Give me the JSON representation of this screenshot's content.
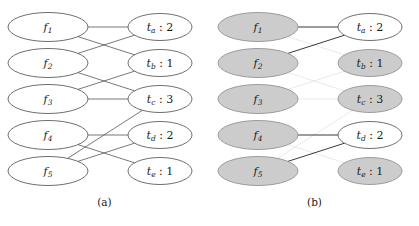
{
  "figure": {
    "panels": [
      {
        "id": "a",
        "caption": "(a)",
        "left_nodes": [
          {
            "id": "f1",
            "base": "f",
            "sub": "1",
            "shaded": false
          },
          {
            "id": "f2",
            "base": "f",
            "sub": "2",
            "shaded": false
          },
          {
            "id": "f3",
            "base": "f",
            "sub": "3",
            "shaded": false
          },
          {
            "id": "f4",
            "base": "f",
            "sub": "4",
            "shaded": false
          },
          {
            "id": "f5",
            "base": "f",
            "sub": "5",
            "shaded": false
          }
        ],
        "right_nodes": [
          {
            "id": "ta",
            "base": "t",
            "sub": "a",
            "colon": ":",
            "value": "2",
            "shaded": false
          },
          {
            "id": "tb",
            "base": "t",
            "sub": "b",
            "colon": ":",
            "value": "1",
            "shaded": false
          },
          {
            "id": "tc",
            "base": "t",
            "sub": "c",
            "colon": ":",
            "value": "3",
            "shaded": false
          },
          {
            "id": "td",
            "base": "t",
            "sub": "d",
            "colon": ":",
            "value": "2",
            "shaded": false
          },
          {
            "id": "te",
            "base": "t",
            "sub": "e",
            "colon": ":",
            "value": "1",
            "shaded": false
          }
        ],
        "edges": [
          {
            "from": "f1",
            "to": "ta",
            "style": "normal"
          },
          {
            "from": "f1",
            "to": "tb",
            "style": "normal"
          },
          {
            "from": "f2",
            "to": "ta",
            "style": "normal"
          },
          {
            "from": "f2",
            "to": "tc",
            "style": "normal"
          },
          {
            "from": "f3",
            "to": "tb",
            "style": "normal"
          },
          {
            "from": "f3",
            "to": "tc",
            "style": "normal"
          },
          {
            "from": "f4",
            "to": "td",
            "style": "normal"
          },
          {
            "from": "f4",
            "to": "te",
            "style": "normal"
          },
          {
            "from": "f5",
            "to": "tc",
            "style": "normal"
          },
          {
            "from": "f5",
            "to": "td",
            "style": "normal"
          }
        ]
      },
      {
        "id": "b",
        "caption": "(b)",
        "left_nodes": [
          {
            "id": "f1",
            "base": "f",
            "sub": "1",
            "shaded": true
          },
          {
            "id": "f2",
            "base": "f",
            "sub": "2",
            "shaded": true
          },
          {
            "id": "f3",
            "base": "f",
            "sub": "3",
            "shaded": true
          },
          {
            "id": "f4",
            "base": "f",
            "sub": "4",
            "shaded": true
          },
          {
            "id": "f5",
            "base": "f",
            "sub": "5",
            "shaded": true
          }
        ],
        "right_nodes": [
          {
            "id": "ta",
            "base": "t",
            "sub": "a",
            "colon": ":",
            "value": "2",
            "shaded": false
          },
          {
            "id": "tb",
            "base": "t",
            "sub": "b",
            "colon": ":",
            "value": "1",
            "shaded": true
          },
          {
            "id": "tc",
            "base": "t",
            "sub": "c",
            "colon": ":",
            "value": "3",
            "shaded": true
          },
          {
            "id": "td",
            "base": "t",
            "sub": "d",
            "colon": ":",
            "value": "2",
            "shaded": false
          },
          {
            "id": "te",
            "base": "t",
            "sub": "e",
            "colon": ":",
            "value": "1",
            "shaded": true
          }
        ],
        "edges": [
          {
            "from": "f1",
            "to": "ta",
            "style": "strong"
          },
          {
            "from": "f1",
            "to": "tb",
            "style": "faded"
          },
          {
            "from": "f2",
            "to": "ta",
            "style": "strong"
          },
          {
            "from": "f2",
            "to": "tc",
            "style": "faded"
          },
          {
            "from": "f3",
            "to": "tb",
            "style": "faded"
          },
          {
            "from": "f3",
            "to": "tc",
            "style": "faded"
          },
          {
            "from": "f4",
            "to": "td",
            "style": "strong"
          },
          {
            "from": "f4",
            "to": "te",
            "style": "faded"
          },
          {
            "from": "f5",
            "to": "tc",
            "style": "faded"
          },
          {
            "from": "f5",
            "to": "td",
            "style": "strong"
          }
        ]
      }
    ],
    "geometry": {
      "left_cx": 48,
      "right_cx": 160,
      "left_rx": 40,
      "left_ry": 14.5,
      "right_rx": 32,
      "right_ry": 13.5,
      "row_y": [
        27,
        63,
        99,
        135,
        171
      ]
    },
    "colors": {
      "node_fill_open": "#ffffff",
      "node_fill_shaded": "#cccccc",
      "node_stroke": "#4a4a4a",
      "edge_normal": "#555555",
      "edge_strong": "#3a3a3a",
      "edge_faded": "#e2e2e2"
    }
  }
}
